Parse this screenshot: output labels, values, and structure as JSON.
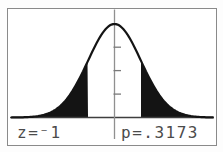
{
  "window": {
    "description": "Graphing-calculator ShadeNorm screen",
    "background": "#ffffff",
    "border_color": "#8a8a8a"
  },
  "readouts": {
    "z": "z=⁻1",
    "p": "p=.3173"
  },
  "colors": {
    "curve": "#141414",
    "shade_fill": "#141414",
    "x_axis": "#3f3f3f",
    "y_axis": "#909090",
    "tick": "#7a7a7a",
    "text": "#4b4b4b"
  },
  "chart_data": {
    "type": "area",
    "distribution": "standard normal pdf",
    "x_range": [
      -4.3,
      4.3
    ],
    "y_range": [
      0,
      0.42
    ],
    "y_tick_values": [
      0.1,
      0.2,
      0.3
    ],
    "shaded_regions": [
      {
        "from": -4.3,
        "to": -1
      },
      {
        "from": 1,
        "to": 4.3
      }
    ],
    "z": -1,
    "p": 0.3173,
    "annotations": [
      "z=⁻1",
      "p=.3173"
    ],
    "legend": "none",
    "grid": false
  }
}
